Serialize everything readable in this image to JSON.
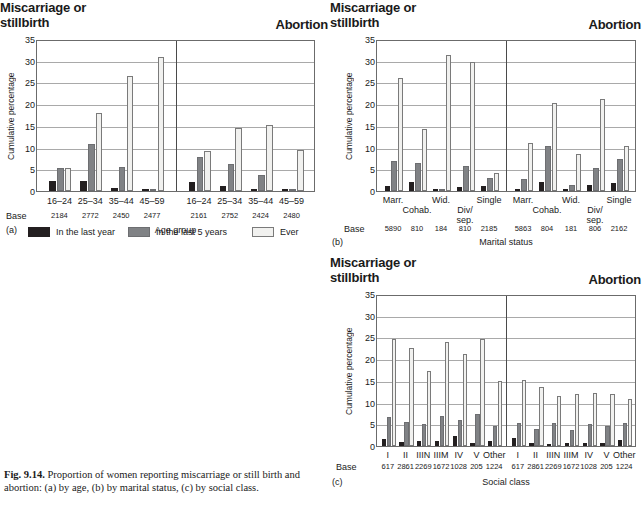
{
  "figure": {
    "caption_label": "Fig. 9.14.",
    "caption_text": " Proportion of women reporting miscarriage or still birth and abortion: (a) by age, (b) by marital status, (c) by social class."
  },
  "legend": {
    "position": "below-panel-a",
    "entries": [
      {
        "label": "In the last year",
        "color": "#231f20"
      },
      {
        "label": "In the last 5 years",
        "color": "#808285"
      },
      {
        "label": "Ever",
        "color": "#f1f1ef"
      }
    ]
  },
  "common": {
    "ylabel": "Cumulative percentage",
    "base_word": "Base",
    "heading_left": "Miscarriage or stillbirth",
    "heading_left_line1": "Miscarriage or",
    "heading_left_line2": "stillbirth",
    "heading_right": "Abortion",
    "yticks": [
      0,
      5,
      10,
      15,
      20,
      25,
      30,
      35
    ],
    "ylim": [
      0,
      35
    ]
  },
  "chart_data": [
    {
      "id": "a",
      "panel_id": "(a)",
      "type": "bar",
      "title": "Miscarriage or stillbirth / Abortion",
      "xlabel": "Age group",
      "ylabel": "Cumulative percentage",
      "ylim": [
        0,
        35
      ],
      "yticks": [
        0,
        5,
        10,
        15,
        20,
        25,
        30,
        35
      ],
      "grid": true,
      "legend_position": "below",
      "groups": [
        {
          "group_label": "Miscarriage or stillbirth",
          "categories": [
            "16–24",
            "25–34",
            "35–44",
            "45–59"
          ],
          "bases": [
            "2184",
            "2772",
            "2450",
            "2477"
          ],
          "series": [
            {
              "name": "In the last year",
              "values": [
                2.2,
                2.3,
                0.7,
                0.1
              ]
            },
            {
              "name": "In the last 5 years",
              "values": [
                5.2,
                10.8,
                5.5,
                0.5
              ]
            },
            {
              "name": "Ever",
              "values": [
                5.4,
                17.9,
                26.5,
                30.9
              ]
            }
          ]
        },
        {
          "group_label": "Abortion",
          "categories": [
            "16–24",
            "25–34",
            "35–44",
            "45–59"
          ],
          "bases": [
            "2161",
            "2752",
            "2424",
            "2480"
          ],
          "series": [
            {
              "name": "In the last year",
              "values": [
                2.1,
                1.1,
                0.4,
                0.1
              ]
            },
            {
              "name": "In the last 5 years",
              "values": [
                7.9,
                6.2,
                3.6,
                0.2
              ]
            },
            {
              "name": "Ever",
              "values": [
                9.1,
                14.6,
                15.3,
                9.5
              ]
            }
          ]
        }
      ]
    },
    {
      "id": "b",
      "panel_id": "(b)",
      "type": "bar",
      "title": "Miscarriage or stillbirth / Abortion",
      "xlabel": "Marital status",
      "ylabel": "Cumulative percentage",
      "ylim": [
        0,
        35
      ],
      "yticks": [
        0,
        5,
        10,
        15,
        20,
        25,
        30,
        35
      ],
      "grid": true,
      "groups": [
        {
          "group_label": "Miscarriage or stillbirth",
          "categories": [
            "Marr.",
            "Cohab.",
            "Wid.",
            "Div/ sep.",
            "Single"
          ],
          "bases": [
            "5890",
            "810",
            "184",
            "810",
            "2185"
          ],
          "series": [
            {
              "name": "In the last year",
              "values": [
                1.2,
                2.0,
                0.1,
                1.0,
                1.1
              ]
            },
            {
              "name": "In the last 5 years",
              "values": [
                6.8,
                6.4,
                0.2,
                5.7,
                2.9
              ]
            },
            {
              "name": "Ever",
              "values": [
                26.0,
                14.3,
                31.4,
                29.8,
                4.2
              ]
            }
          ]
        },
        {
          "group_label": "Abortion",
          "categories": [
            "Marr.",
            "Cohab.",
            "Wid.",
            "Div/ sep.",
            "Single"
          ],
          "bases": [
            "5863",
            "804",
            "181",
            "806",
            "2162"
          ],
          "series": [
            {
              "name": "In the last year",
              "values": [
                0.4,
                2.0,
                0.1,
                1.4,
                1.8
              ]
            },
            {
              "name": "In the last 5 years",
              "values": [
                2.7,
                10.3,
                1.3,
                5.4,
                7.3
              ]
            },
            {
              "name": "Ever",
              "values": [
                11.0,
                20.2,
                8.6,
                21.2,
                10.3
              ]
            }
          ]
        }
      ]
    },
    {
      "id": "c",
      "panel_id": "(c)",
      "type": "bar",
      "title": "Miscarriage or stillbirth / Abortion",
      "xlabel": "Social class",
      "ylabel": "Cumulative percentage",
      "ylim": [
        0,
        35
      ],
      "yticks": [
        0,
        5,
        10,
        15,
        20,
        25,
        30,
        35
      ],
      "grid": true,
      "groups": [
        {
          "group_label": "Miscarriage or stillbirth",
          "categories": [
            "I",
            "II",
            "IIIN",
            "IIIM",
            "IV",
            "V",
            "Other"
          ],
          "bases": [
            "617",
            "2861",
            "2269",
            "1672",
            "1028",
            "205",
            "1224"
          ],
          "series": [
            {
              "name": "In the last year",
              "values": [
                1.6,
                0.9,
                1.2,
                1.2,
                2.2,
                0.6,
                1.1
              ]
            },
            {
              "name": "In the last 5 years",
              "values": [
                6.6,
                5.6,
                5.0,
                7.0,
                6.0,
                7.3,
                4.5
              ]
            },
            {
              "name": "Ever",
              "values": [
                24.6,
                22.5,
                17.2,
                24.0,
                21.1,
                24.6,
                15.0
              ]
            }
          ]
        },
        {
          "group_label": "Abortion",
          "categories": [
            "I",
            "II",
            "IIIN",
            "IIIM",
            "IV",
            "V",
            "Other"
          ],
          "bases": [
            "617",
            "2861",
            "2269",
            "1672",
            "1028",
            "205",
            "1224"
          ],
          "series": [
            {
              "name": "In the last year",
              "values": [
                1.9,
                0.6,
                0.4,
                0.8,
                0.8,
                0.6,
                1.3
              ]
            },
            {
              "name": "In the last 5 years",
              "values": [
                5.3,
                4.0,
                5.2,
                3.8,
                5.1,
                4.5,
                5.2
              ]
            },
            {
              "name": "Ever",
              "values": [
                15.3,
                13.6,
                11.6,
                11.9,
                12.3,
                11.9,
                10.8
              ]
            }
          ]
        }
      ]
    }
  ]
}
